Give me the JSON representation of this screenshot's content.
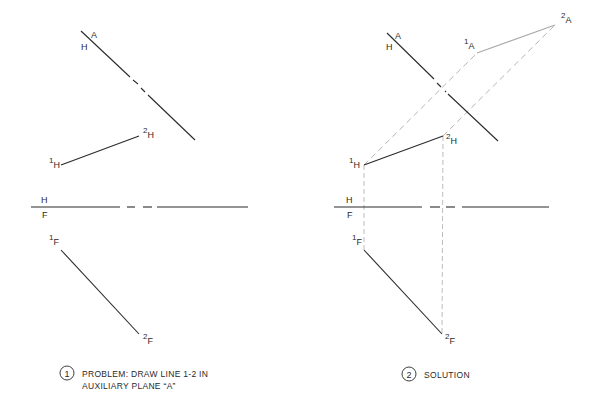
{
  "colors": {
    "background": "#ffffff",
    "solid_line": "#2a2a2a",
    "construction_line": "#b5b5b5",
    "auxiliary_line": "#a8a8a8",
    "text": "#2a2a2a"
  },
  "panels": [
    {
      "id": "problem",
      "caption": {
        "number": "1",
        "line1": "PROBLEM:  DRAW LINE 1-2 IN",
        "line2": "AUXILIARY PLANE “A”"
      },
      "fold_line_HA": {
        "label_top": "A",
        "label_bottom": "H",
        "segments": [
          [
            81,
            31,
            130,
            77
          ],
          [
            133,
            80,
            138,
            84
          ],
          [
            141,
            88,
            145,
            92
          ],
          [
            148,
            95,
            195,
            140
          ]
        ]
      },
      "fold_line_HF": {
        "label_top": "H",
        "label_bottom": "F",
        "segments": [
          [
            31,
            207,
            120,
            207
          ],
          [
            127,
            207,
            135,
            207
          ],
          [
            143,
            207,
            152,
            207
          ],
          [
            157,
            207,
            248,
            207
          ]
        ]
      },
      "points": {
        "1H": {
          "x": 61,
          "y": 165,
          "num": "1",
          "sub": "H",
          "lx": 49,
          "ly": 166
        },
        "2H": {
          "x": 139,
          "y": 136,
          "num": "2",
          "sub": "H",
          "lx": 143,
          "ly": 136
        },
        "1F": {
          "x": 61,
          "y": 250,
          "num": "1",
          "sub": "F",
          "lx": 49,
          "ly": 243
        },
        "2F": {
          "x": 139,
          "y": 334,
          "num": "2",
          "sub": "F",
          "lx": 143,
          "ly": 342
        }
      }
    },
    {
      "id": "solution",
      "caption": {
        "number": "2",
        "line1": "SOLUTION"
      },
      "fold_line_HA": {
        "label_top": "A",
        "label_bottom": "H",
        "segments": [
          [
            387,
            33,
            434,
            79
          ],
          [
            437,
            83,
            441,
            87
          ],
          [
            445,
            91,
            446,
            92
          ],
          [
            448,
            94,
            498,
            141
          ]
        ]
      },
      "fold_line_HF": {
        "label_top": "H",
        "label_bottom": "F",
        "segments": [
          [
            334,
            207,
            422,
            207
          ],
          [
            430,
            207,
            440,
            207
          ],
          [
            446,
            207,
            455,
            207
          ],
          [
            462,
            207,
            549,
            207
          ]
        ]
      },
      "points": {
        "1H": {
          "x": 364,
          "y": 165,
          "num": "1",
          "sub": "H",
          "lx": 349,
          "ly": 166
        },
        "2H": {
          "x": 443,
          "y": 136,
          "num": "2",
          "sub": "H",
          "lx": 446,
          "ly": 142
        },
        "1F": {
          "x": 364,
          "y": 250,
          "num": "1",
          "sub": "F",
          "lx": 352,
          "ly": 243
        },
        "2F": {
          "x": 442,
          "y": 334,
          "num": "2",
          "sub": "F",
          "lx": 445,
          "ly": 342
        },
        "1A": {
          "x": 477,
          "y": 53,
          "num": "1",
          "sub": "A",
          "lx": 464,
          "ly": 47
        },
        "2A": {
          "x": 555,
          "y": 25,
          "num": "2",
          "sub": "A",
          "lx": 561,
          "ly": 21
        }
      },
      "projectors": [
        {
          "from": "1H",
          "to": "1A"
        },
        {
          "from": "2H",
          "to": "2A"
        },
        {
          "from": "1H",
          "to": "1F"
        },
        {
          "from": "2H",
          "to": "2F"
        }
      ]
    }
  ]
}
